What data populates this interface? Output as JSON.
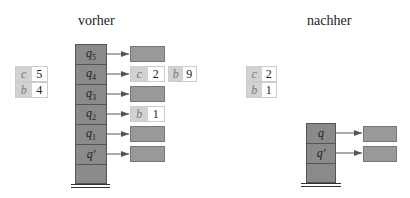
{
  "before": {
    "title": "vorher",
    "table": [
      {
        "key": "c",
        "value": "5"
      },
      {
        "key": "b",
        "value": "4"
      }
    ],
    "stack": [
      {
        "label": "q",
        "sub": "5",
        "prime": false,
        "target": "empty"
      },
      {
        "label": "q",
        "sub": "4",
        "prime": false,
        "target": "c2"
      },
      {
        "label": "q",
        "sub": "3",
        "prime": false,
        "target": "empty"
      },
      {
        "label": "q",
        "sub": "2",
        "prime": false,
        "target": "b1"
      },
      {
        "label": "q",
        "sub": "1",
        "prime": false,
        "target": "empty"
      },
      {
        "label": "q",
        "sub": "",
        "prime": true,
        "target": "empty"
      },
      {
        "label": "",
        "sub": "",
        "prime": false,
        "target": null
      }
    ],
    "entries": {
      "q4": {
        "key": "c",
        "value": "2"
      },
      "q4_extra": {
        "key": "b",
        "value": "9"
      },
      "q2": {
        "key": "b",
        "value": "1"
      }
    }
  },
  "after": {
    "title": "nachher",
    "table": [
      {
        "key": "c",
        "value": "2"
      },
      {
        "key": "b",
        "value": "1"
      }
    ],
    "stack": [
      {
        "label": "q",
        "sub": "",
        "prime": false
      },
      {
        "label": "q",
        "sub": "",
        "prime": true
      }
    ]
  }
}
